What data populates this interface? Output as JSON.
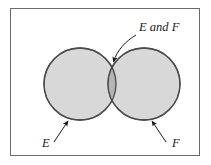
{
  "figure": {
    "type": "venn-diagram",
    "title": "",
    "frame": {
      "border_color": "#6b6b6b",
      "background_color": "#ffffff",
      "x": 10,
      "y": 8,
      "width": 190,
      "height": 148
    },
    "sets": [
      {
        "id": "E",
        "label": "E",
        "center_x": 80,
        "center_y": 84,
        "radius": 36,
        "fill_color": "#d8d8d8",
        "stroke_color": "#4a4a4a",
        "label_x": 42,
        "label_y": 146,
        "leader_from": [
          54,
          142
        ],
        "leader_to": [
          68,
          121
        ]
      },
      {
        "id": "F",
        "label": "F",
        "center_x": 144,
        "center_y": 84,
        "radius": 36,
        "fill_color": "#d8d8d8",
        "stroke_color": "#4a4a4a",
        "label_x": 172,
        "label_y": 146,
        "leader_from": [
          166,
          142
        ],
        "leader_to": [
          152,
          121
        ]
      }
    ],
    "intersection": {
      "label": "E and F",
      "fill_color": "#b4b4b4",
      "stroke_color": "#4a4a4a",
      "label_x": 139,
      "label_y": 31,
      "leader_from": [
        136,
        35
      ],
      "leader_to": [
        113,
        70
      ]
    },
    "colors": {
      "set_fill": "#d8d8d8",
      "intersection_fill": "#b4b4b4",
      "outline": "#4a4a4a",
      "frame": "#6b6b6b",
      "text": "#1a1a1a",
      "page_background": "#ffffff"
    }
  }
}
